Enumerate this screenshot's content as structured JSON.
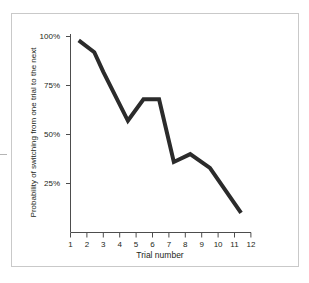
{
  "figure": {
    "background_color": "#ffffff",
    "frame_color": "#c9c9c9",
    "line_color": "#2b2b2b",
    "axis_color": "#4d4d4d",
    "text_color": "#231f20"
  },
  "chart_data": {
    "type": "line",
    "title": "",
    "subtitle": "",
    "xlabel": "Trial number",
    "ylabel": "Probability of switching from one trial to the next",
    "xlim": [
      1,
      12
    ],
    "ylim": [
      0,
      100
    ],
    "grid": false,
    "legend": null,
    "legend_position": "none",
    "x_tick_labels": [
      "1",
      "2",
      "3",
      "4",
      "5",
      "6",
      "7",
      "8",
      "9",
      "10",
      "11",
      "12"
    ],
    "x_ticks": [
      1,
      2,
      3,
      4,
      5,
      6,
      7,
      8,
      9,
      10,
      11,
      12
    ],
    "y_tick_labels": [
      "25%",
      "50%",
      "75%",
      "100%"
    ],
    "y_ticks": [
      25,
      50,
      75,
      100
    ],
    "series": [
      {
        "name": "Probability of switching",
        "color": "#2b2b2b",
        "x": [
          1.5,
          2.45,
          3.0,
          4.5,
          5.45,
          6.4,
          7.3,
          8.3,
          9.5,
          11.4
        ],
        "values": [
          98,
          92,
          82,
          57,
          68,
          68,
          36,
          40,
          33,
          10
        ]
      }
    ],
    "annotations": []
  },
  "axes": {
    "y_title": "Probability of switching from one trial to the next",
    "x_title": "Trial number"
  }
}
